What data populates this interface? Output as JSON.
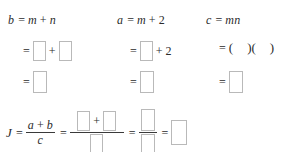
{
  "document": {
    "title": "Algebra factoring worksheet with blank answer boxes",
    "background_color": "#ffffff",
    "text_color": "#2b2b2b",
    "box_border_color": "#b9b9b9"
  },
  "symbols": {
    "equals": "=",
    "plus": "+",
    "paren_open": "(",
    "paren_close": ")"
  },
  "columns": [
    {
      "id": "column-b",
      "line1": {
        "lhs": "b",
        "equals": "=",
        "term1": "m",
        "plus": "+",
        "term2": "n"
      },
      "line2": {
        "equals": "=",
        "plus": "+"
      },
      "line3": {
        "equals": "="
      }
    },
    {
      "id": "column-a",
      "line1": {
        "lhs": "a",
        "equals": "=",
        "term1": "m",
        "plus": "+",
        "term2": "2"
      },
      "line2": {
        "equals": "=",
        "plus": "+",
        "constant": "2"
      },
      "line3": {
        "equals": "="
      }
    },
    {
      "id": "column-c",
      "line1": {
        "lhs": "c",
        "equals": "=",
        "term1": "m",
        "term2": "n"
      },
      "line2": {
        "equals": "=",
        "paren_open_1": "(",
        "paren_close_1": ")",
        "paren_open_2": "(",
        "paren_close_2": ")"
      },
      "line3": {
        "equals": "="
      }
    }
  ],
  "final_expression": {
    "id": "J-expression",
    "lhs": "J",
    "equals_1": "=",
    "fraction_1": {
      "numerator_term1": "a",
      "numerator_plus": "+",
      "numerator_term2": "b",
      "denominator": "c"
    },
    "equals_2": "=",
    "fraction_2": {
      "numerator_plus": "+"
    },
    "equals_3": "=",
    "equals_4": "="
  }
}
